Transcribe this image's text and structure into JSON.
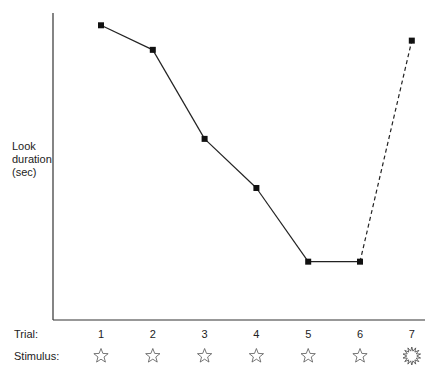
{
  "chart_data": {
    "type": "line",
    "title": "",
    "xlabel": "Trial:",
    "ylabel": "Look duration (sec)",
    "ylabel_lines": [
      "Look",
      "duration",
      "(sec)"
    ],
    "row_labels": {
      "trial": "Trial:",
      "stimulus": "Stimulus:"
    },
    "categories": [
      "1",
      "2",
      "3",
      "4",
      "5",
      "6",
      "7"
    ],
    "stimuli": [
      "star",
      "star",
      "star",
      "star",
      "star",
      "star",
      "burst"
    ],
    "y_units": "relative look duration (no numeric ticks shown)",
    "ylim": [
      0,
      1
    ],
    "grid": false,
    "series": [
      {
        "name": "Look duration",
        "values": [
          0.96,
          0.88,
          0.59,
          0.43,
          0.19,
          0.19,
          0.91
        ],
        "marker": "square",
        "line_styles": [
          "solid",
          "solid",
          "solid",
          "solid",
          "solid",
          "dashed"
        ]
      }
    ]
  }
}
